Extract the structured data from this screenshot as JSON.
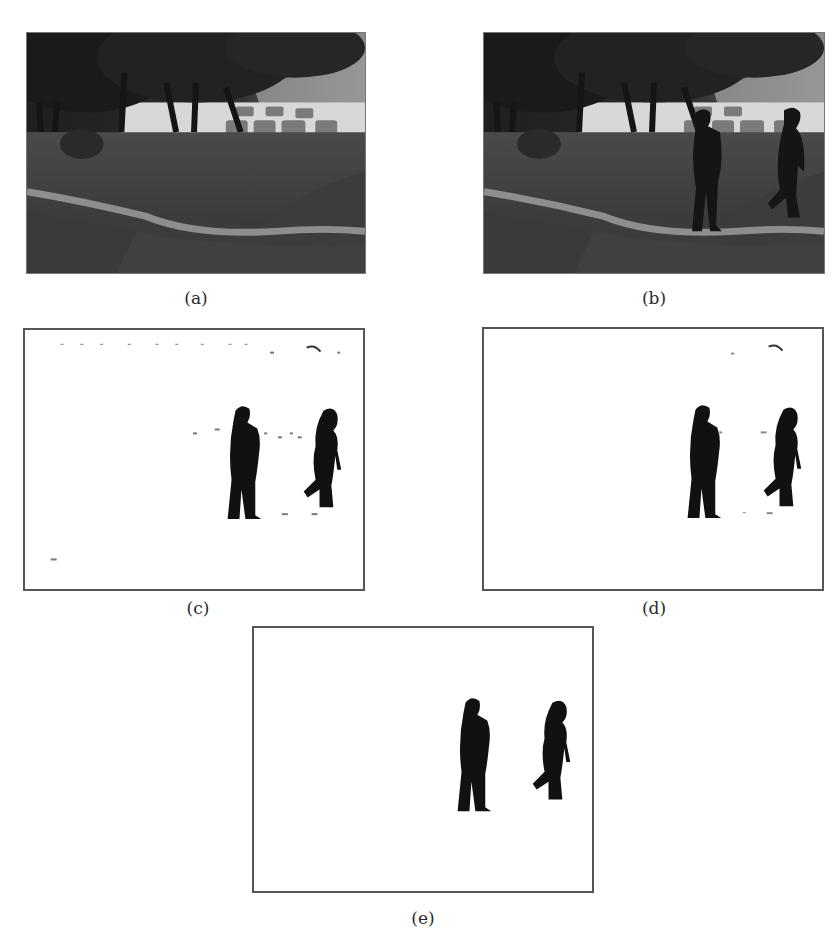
{
  "figure": {
    "panels": [
      {
        "id": "a",
        "label": "(a)",
        "kind": "grayscale-photo",
        "content": "background scene: trees, parked cars, lawn with curved path"
      },
      {
        "id": "b",
        "label": "(b)",
        "kind": "grayscale-photo",
        "content": "same scene with two walking persons"
      },
      {
        "id": "c",
        "label": "(c)",
        "kind": "binary-mask",
        "content": "foreground detection with noise specks"
      },
      {
        "id": "d",
        "label": "(d)",
        "kind": "binary-mask",
        "content": "foreground detection with less noise"
      },
      {
        "id": "e",
        "label": "(e)",
        "kind": "binary-mask",
        "content": "clean foreground silhouettes of two persons"
      }
    ],
    "colors": {
      "background": "#ffffff",
      "mask_foreground": "#111111",
      "frame_border": "#555555",
      "photo_dark": "#2e2e2e"
    }
  }
}
